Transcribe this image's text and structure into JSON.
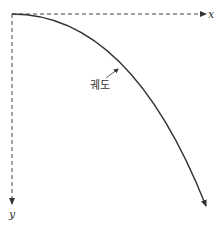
{
  "diagram": {
    "type": "projectile-trajectory",
    "axes": {
      "x_label": "x",
      "y_label": "y",
      "x_direction": "right",
      "y_direction": "down",
      "style": "dashed"
    },
    "curve": {
      "label": "궤도",
      "shape": "parabola",
      "start": "origin",
      "direction": "down-right"
    },
    "colors": {
      "line": "#333333",
      "background": "#ffffff"
    }
  }
}
